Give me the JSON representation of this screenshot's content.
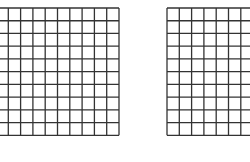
{
  "figure": {
    "background": "#ffffff",
    "line_color": "#333333",
    "grids": [
      {
        "name": "left-grid",
        "x": -5,
        "y": 6.7,
        "cols": 10,
        "rows": 10,
        "cell_w": 12.3,
        "cell_h": 12.73
      },
      {
        "name": "right-grid",
        "x": 165.7,
        "y": 6.7,
        "cols": 10,
        "rows": 10,
        "cell_w": 12.3,
        "cell_h": 12.73
      }
    ]
  }
}
